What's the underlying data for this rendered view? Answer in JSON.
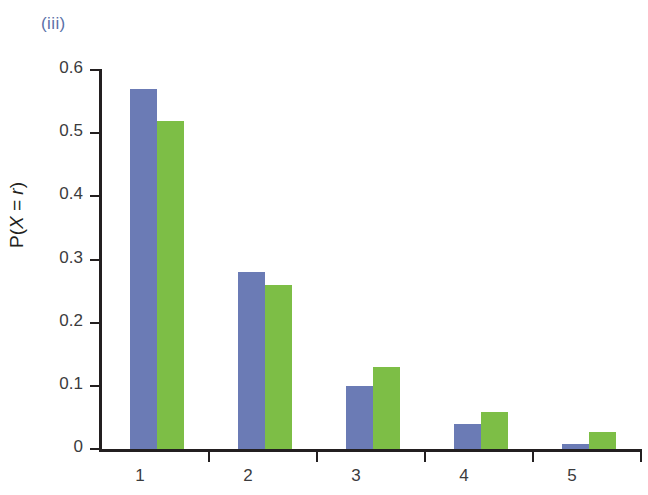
{
  "figure": {
    "part_label": "(iii)"
  },
  "chart_data": {
    "type": "bar",
    "title": "",
    "subtitle": "",
    "xlabel": "",
    "ylabel": "P(X = r)",
    "ylabel_parts": {
      "prefix": "P(",
      "var": "X",
      "equals": " = ",
      "value": "r",
      "suffix": ")"
    },
    "categories": [
      "1",
      "2",
      "3",
      "4",
      "5"
    ],
    "series": [
      {
        "name": "series-1",
        "color": "#6b7bb5",
        "values": [
          0.57,
          0.28,
          0.1,
          0.04,
          0.008
        ]
      },
      {
        "name": "series-2",
        "color": "#7dbe46",
        "values": [
          0.52,
          0.26,
          0.13,
          0.058,
          0.027
        ]
      }
    ],
    "ylim": [
      0,
      0.6
    ],
    "yticks": [
      0,
      0.1,
      0.2,
      0.3,
      0.4,
      0.5,
      0.6
    ],
    "ytick_labels": [
      "0",
      "0.1",
      "0.2",
      "0.3",
      "0.4",
      "0.5",
      "0.6"
    ],
    "grid": false,
    "legend": false,
    "legend_position": "none"
  }
}
